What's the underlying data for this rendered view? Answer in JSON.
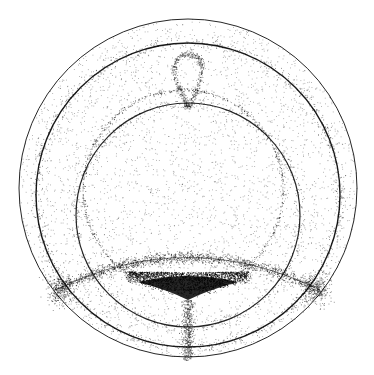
{
  "figure": {
    "title": "",
    "background": "#ffffff",
    "ink": "#000000",
    "width": 374,
    "height": 375
  },
  "curves": {
    "outer_circle": {
      "cx": 188,
      "cy": 188,
      "r": 169,
      "stroke": 1.0,
      "opacity": 0.85
    },
    "second_circle": {
      "cx": 188,
      "cy": 195,
      "r": 152,
      "stroke": 1.4,
      "opacity": 0.9
    },
    "inner_circle": {
      "cx": 188,
      "cy": 215,
      "r": 112,
      "stroke": 1.2,
      "opacity": 0.85
    },
    "dotted_circle": {
      "cx": 183,
      "cy": 190,
      "r": 100,
      "opacity": 0.45
    }
  },
  "features": {
    "top_cusp": {
      "x": 188,
      "y": 42
    },
    "teardrop": {
      "cx": 188,
      "cy": 80,
      "rx": 20,
      "ry": 26
    },
    "lower_arc": {
      "x1": 55,
      "y1": 290,
      "cx": 188,
      "cy": 225,
      "x2": 320,
      "y2": 290
    },
    "dark_cusp": {
      "x": 188,
      "y": 300,
      "width": 120,
      "height": 25
    },
    "bottom_stem": {
      "x": 188,
      "y1": 300,
      "y2": 360
    }
  },
  "noise": {
    "dots": 9000,
    "seed": 7
  }
}
